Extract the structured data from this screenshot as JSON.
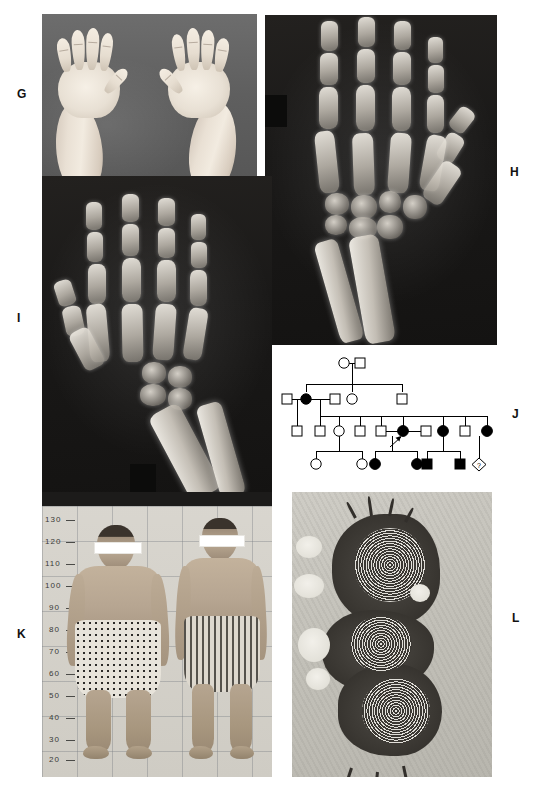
{
  "figure": {
    "caption": ""
  },
  "panels": {
    "g": {
      "label": "G",
      "type": "clinical-photograph",
      "description": "Dorsal view of both hands of an affected individual on a dark grey background",
      "subject_count": 2
    },
    "h": {
      "label": "H",
      "type": "radiograph",
      "description": "Antero-posterior hand and wrist radiograph showing short tubular bones and carpal changes",
      "digits": 5
    },
    "i": {
      "label": "I",
      "type": "radiograph",
      "description": "Antero-posterior hand, wrist and distal forearm radiograph with irregular widened metaphyses of radius and ulna",
      "digits": 5
    },
    "j": {
      "label": "J",
      "type": "pedigree",
      "proband_marker": "arrow",
      "legend": {
        "circle": "female",
        "square": "male",
        "filled": "affected",
        "open": "unaffected",
        "diamond": "sex unknown"
      }
    },
    "k": {
      "label": "K",
      "type": "clinical-photograph",
      "description": "Two affected adults standing against a measuring grid with eyes masked",
      "scale_unit": "cm",
      "scale_values": [
        "130",
        "120",
        "110",
        "100",
        "90",
        "80",
        "70",
        "60",
        "50",
        "40",
        "30",
        "20"
      ],
      "subjects": [
        {
          "name": "subject-left",
          "shorts_pattern": "polka-dot"
        },
        {
          "name": "subject-right",
          "shorts_pattern": "vertical-stripe"
        }
      ]
    },
    "l": {
      "label": "L",
      "type": "electron-micrograph",
      "description": "Transmission electron micrograph showing electron-dense inclusions with concentric lamellar (whorled) membranous bodies"
    }
  },
  "pedigree_data": {
    "type": "pedigree",
    "generations": 4,
    "symbols": {
      "female_unaffected": "open-circle",
      "female_affected": "filled-circle",
      "male_unaffected": "open-square",
      "male_affected": "filled-square",
      "unknown_sex": "open-diamond-question"
    },
    "generation_labels": [
      "I",
      "II",
      "III",
      "IV"
    ],
    "individuals": [
      {
        "id": "I-1",
        "gen": 1,
        "sex": "female",
        "affected": false
      },
      {
        "id": "I-2",
        "gen": 1,
        "sex": "male",
        "affected": false
      },
      {
        "id": "II-1",
        "gen": 2,
        "sex": "male",
        "affected": false
      },
      {
        "id": "II-2",
        "gen": 2,
        "sex": "female",
        "affected": true
      },
      {
        "id": "II-3",
        "gen": 2,
        "sex": "male",
        "affected": false
      },
      {
        "id": "II-4",
        "gen": 2,
        "sex": "female",
        "affected": false
      },
      {
        "id": "II-5",
        "gen": 2,
        "sex": "male",
        "affected": false
      },
      {
        "id": "III-1",
        "gen": 3,
        "sex": "male",
        "affected": false
      },
      {
        "id": "III-2",
        "gen": 3,
        "sex": "male",
        "affected": false
      },
      {
        "id": "III-3",
        "gen": 3,
        "sex": "female",
        "affected": false
      },
      {
        "id": "III-4",
        "gen": 3,
        "sex": "male",
        "affected": false
      },
      {
        "id": "III-5",
        "gen": 3,
        "sex": "male",
        "affected": false
      },
      {
        "id": "III-6",
        "gen": 3,
        "sex": "female",
        "affected": true,
        "proband": true
      },
      {
        "id": "III-7",
        "gen": 3,
        "sex": "male",
        "affected": false
      },
      {
        "id": "III-8",
        "gen": 3,
        "sex": "female",
        "affected": true
      },
      {
        "id": "III-9",
        "gen": 3,
        "sex": "male",
        "affected": false
      },
      {
        "id": "III-10",
        "gen": 3,
        "sex": "female",
        "affected": true
      },
      {
        "id": "IV-1",
        "gen": 4,
        "sex": "female",
        "affected": false
      },
      {
        "id": "IV-2",
        "gen": 4,
        "sex": "female",
        "affected": false
      },
      {
        "id": "IV-3",
        "gen": 4,
        "sex": "female",
        "affected": true
      },
      {
        "id": "IV-4",
        "gen": 4,
        "sex": "female",
        "affected": true
      },
      {
        "id": "IV-5",
        "gen": 4,
        "sex": "male",
        "affected": true
      },
      {
        "id": "IV-6",
        "gen": 4,
        "sex": "male",
        "affected": true
      },
      {
        "id": "IV-7",
        "gen": 4,
        "sex": "unknown",
        "affected": false,
        "marker": "?"
      }
    ],
    "unknown_marker_text": "?",
    "counts": {
      "total": 24,
      "affected": 7,
      "unaffected": 16,
      "unknown": 1
    }
  },
  "scale_k": {
    "labels": [
      "130",
      "120",
      "110",
      "100",
      "90",
      "80",
      "70",
      "60",
      "50",
      "40",
      "30",
      "20"
    ]
  },
  "colors": {
    "page_background": "#ffffff",
    "label_text": "#111111",
    "xray_background": "#1a1918",
    "bone_bright": "#ecE8e0",
    "photo_background_g": "#5f5f5f",
    "pedigree_stroke": "#000000",
    "pedigree_fill_affected": "#000000",
    "grid_line_k": "#787c82",
    "micrograph_dense": "#3b3833",
    "micrograph_matrix": "#c5c3bb"
  }
}
